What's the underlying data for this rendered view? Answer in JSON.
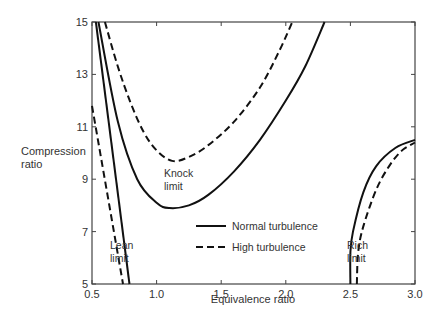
{
  "chart_data": {
    "type": "line",
    "title": "",
    "xlabel": "Equivalence ratio",
    "ylabel": "Compression ratio",
    "xlim": [
      0.5,
      3.0
    ],
    "ylim": [
      5,
      15
    ],
    "grid": false,
    "x_ticks": [
      "0.5",
      "1.0",
      "1.5",
      "2.0",
      "2.5",
      "3.0"
    ],
    "y_ticks": [
      "5",
      "7",
      "9",
      "11",
      "13",
      "15"
    ],
    "legend": {
      "position": "inside-lower-center",
      "entries": [
        {
          "label": "Normal turbulence",
          "style": "solid"
        },
        {
          "label": "High turbulence",
          "style": "dashed"
        }
      ]
    },
    "annotations": [
      {
        "text": [
          "Knock",
          "limit"
        ],
        "x": 1.1,
        "y": 9.1
      },
      {
        "text": [
          "Lean",
          "limit"
        ],
        "x": 0.72,
        "y": 6.2
      },
      {
        "text": [
          "Rich",
          "limit"
        ],
        "x": 2.55,
        "y": 6.2
      }
    ],
    "series": [
      {
        "name": "Lean limit - Normal turbulence",
        "style": "solid",
        "x": [
          0.53,
          0.79
        ],
        "y": [
          15,
          5
        ]
      },
      {
        "name": "Lean limit - High turbulence",
        "style": "dashed",
        "x": [
          0.5,
          0.74
        ],
        "y": [
          11.8,
          5
        ]
      },
      {
        "name": "Knock limit - Normal turbulence",
        "style": "solid",
        "x": [
          0.55,
          0.7,
          0.85,
          1.0,
          1.1,
          1.25,
          1.4,
          1.6,
          1.8,
          2.0,
          2.15,
          2.3
        ],
        "y": [
          15,
          11.2,
          9.0,
          8.1,
          7.9,
          8.0,
          8.4,
          9.3,
          10.5,
          12.0,
          13.3,
          15
        ]
      },
      {
        "name": "Knock limit - High turbulence",
        "style": "dashed",
        "x": [
          0.6,
          0.7,
          0.8,
          0.9,
          1.0,
          1.12,
          1.25,
          1.4,
          1.6,
          1.8,
          1.95,
          2.05
        ],
        "y": [
          15,
          13.3,
          11.9,
          10.8,
          10.1,
          9.7,
          9.85,
          10.3,
          11.2,
          12.5,
          13.9,
          15
        ]
      },
      {
        "name": "Rich limit - Normal turbulence",
        "style": "solid",
        "x": [
          2.5,
          2.5,
          2.52,
          2.6,
          2.7,
          2.85,
          3.0
        ],
        "y": [
          5,
          6.2,
          7.0,
          8.5,
          9.5,
          10.2,
          10.5
        ]
      },
      {
        "name": "Rich limit - High turbulence",
        "style": "dashed",
        "x": [
          2.55,
          2.56,
          2.6,
          2.7,
          2.8,
          2.9,
          3.0
        ],
        "y": [
          5,
          6.2,
          7.2,
          8.6,
          9.5,
          10.1,
          10.4
        ]
      }
    ]
  }
}
